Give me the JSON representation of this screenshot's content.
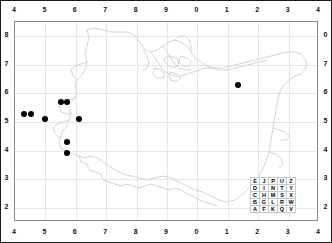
{
  "figure": {
    "type": "species-distribution-map",
    "frame_color": "#1a1a1a",
    "plot_border_color": "#8a8a8a",
    "grid_color": "#e6e6e6",
    "dot_color": "#000000",
    "outline_color": "#cccccc",
    "background": "#ffffff"
  },
  "axes": {
    "top_labels": [
      "4",
      "5",
      "6",
      "7",
      "8",
      "9",
      "0",
      "1",
      "2",
      "3",
      "4"
    ],
    "bottom_labels": [
      "4",
      "5",
      "6",
      "7",
      "8",
      "9",
      "0",
      "1",
      "2",
      "3",
      "4"
    ],
    "left_labels": [
      "8",
      "7",
      "6",
      "5",
      "4",
      "3",
      "2"
    ],
    "right_labels": [
      "0",
      "7",
      "6",
      "5",
      "4",
      "3",
      "2"
    ]
  },
  "legend": {
    "name": "dinty-grid-key",
    "rows": [
      [
        "E",
        "J",
        "P",
        "U",
        "Z"
      ],
      [
        "D",
        "I",
        "N",
        "T",
        "Y"
      ],
      [
        "C",
        "H",
        "M",
        "S",
        "X"
      ],
      [
        "B",
        "G",
        "L",
        "R",
        "W"
      ],
      [
        "A",
        "F",
        "K",
        "Q",
        "V"
      ]
    ]
  },
  "chart_data": {
    "type": "scatter",
    "title": "",
    "xlabel": "",
    "ylabel": "",
    "xlim": [
      4,
      14
    ],
    "ylim": [
      1.5,
      8.5
    ],
    "grid": true,
    "legend_position": "bottom-right",
    "series": [
      {
        "name": "records",
        "marker": "filled-circle",
        "color": "#000000",
        "points": [
          {
            "x": 4.3,
            "y": 5.28
          },
          {
            "x": 4.52,
            "y": 5.28
          },
          {
            "x": 5.0,
            "y": 5.1
          },
          {
            "x": 5.52,
            "y": 5.7
          },
          {
            "x": 5.72,
            "y": 5.7
          },
          {
            "x": 6.1,
            "y": 5.1
          },
          {
            "x": 5.7,
            "y": 4.3
          },
          {
            "x": 5.7,
            "y": 3.93
          },
          {
            "x": 11.32,
            "y": 6.3
          }
        ]
      }
    ]
  }
}
